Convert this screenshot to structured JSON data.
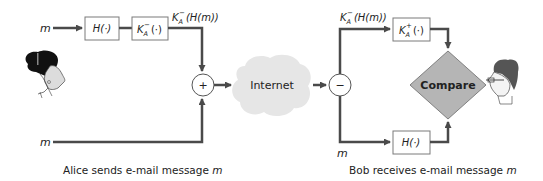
{
  "sender": {
    "input_top": "m",
    "input_bottom": "m",
    "hash_box": "H(·)",
    "sign_box": {
      "base": "K",
      "sub": "A",
      "sup": "−",
      "rest": "(·)"
    },
    "signed_label": {
      "base": "K",
      "sub": "A",
      "sup": "−",
      "rest": "(H(m))"
    },
    "combine_symbol": "+",
    "caption_prefix": "Alice sends e-mail message ",
    "caption_var": "m"
  },
  "network": {
    "label": "Internet"
  },
  "receiver": {
    "split_symbol": "−",
    "signed_label": {
      "base": "K",
      "sub": "A",
      "sup": "−",
      "rest": "(H(m))"
    },
    "verify_box": {
      "base": "K",
      "sub": "A",
      "sup": "+",
      "rest": "(·)"
    },
    "input_bottom": "m",
    "hash_box": "H(·)",
    "compare_label": "Compare",
    "caption_prefix": "Bob receives e-mail message ",
    "caption_var": "m"
  },
  "colors": {
    "line": "#4a4a4a",
    "box_border": "#7a7a7a",
    "cloud": "#e6e6e6",
    "diamond_fill": "#b5b5b5",
    "diamond_stroke": "#808080",
    "text": "#222222"
  }
}
